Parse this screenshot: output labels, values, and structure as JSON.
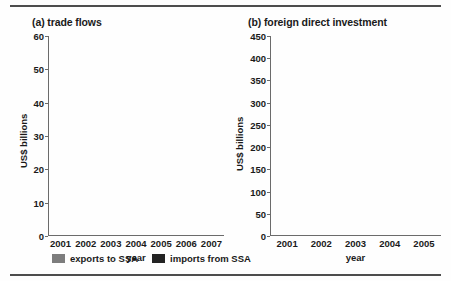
{
  "figure": {
    "background_color": "#ffffff",
    "rule_color": "#4d4d4d"
  },
  "colors": {
    "exports": "#7d7d7d",
    "imports": "#232323",
    "fdi_bar": "#656565",
    "axis": "#6b6b6b",
    "text": "#1a1a1a"
  },
  "legend": {
    "exports_label": "exports to SSA",
    "imports_label": "imports from SSA"
  },
  "chart_data": [
    {
      "type": "bar",
      "id": "trade-flows",
      "title": "(a) trade flows",
      "xlabel": "year",
      "ylabel": "US$ billions",
      "categories": [
        "2001",
        "2002",
        "2003",
        "2004",
        "2005",
        "2006",
        "2007"
      ],
      "ylim": [
        0,
        60
      ],
      "yticks": [
        0,
        10,
        20,
        30,
        40,
        50,
        60
      ],
      "grid": false,
      "stacked": true,
      "legend_position": "below-left",
      "series": [
        {
          "name": "exports to SSA",
          "values": [
            4.3,
            4.7,
            7.0,
            9.5,
            12.8,
            18.4,
            25.0
          ]
        },
        {
          "name": "imports from SSA",
          "values": [
            4.3,
            4.8,
            7.7,
            14.0,
            18.6,
            25.0,
            32.2
          ]
        }
      ],
      "totals": [
        8.6,
        9.5,
        14.7,
        23.5,
        31.4,
        43.4,
        57.2
      ]
    },
    {
      "type": "bar",
      "id": "foreign-direct-investment",
      "title": "(b) foreign direct investment",
      "xlabel": "year",
      "ylabel": "US$ billions",
      "categories": [
        "2001",
        "2002",
        "2003",
        "2004",
        "2005"
      ],
      "ylim": [
        0,
        450
      ],
      "yticks": [
        0,
        50,
        100,
        150,
        200,
        250,
        300,
        350,
        400,
        450
      ],
      "grid": false,
      "stacked": false,
      "legend_position": "none",
      "series": [
        {
          "name": "foreign direct investment",
          "values": [
            51,
            42,
            87,
            426,
            331
          ]
        }
      ]
    }
  ]
}
